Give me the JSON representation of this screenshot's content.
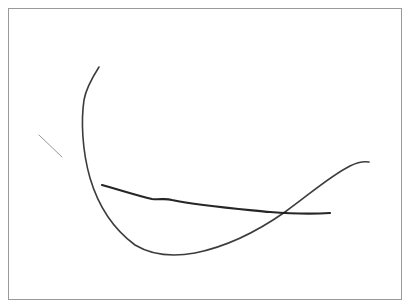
{
  "canvas": {
    "background": "#ffffff",
    "border_color": "#9a9a9a",
    "stroke_color": "#1a1a1a"
  },
  "strokes": [
    {
      "name": "large-curve",
      "path": "M99 67 C92 78 86 88 84 100 C81 120 82 150 90 178 C98 205 112 228 135 245 C150 254 168 258 195 253 C225 247 255 233 285 212 C310 194 330 176 350 166 C358 162 363 161 369 162",
      "width": 1.6,
      "opacity": 0.85
    },
    {
      "name": "horizontal-stroke",
      "path": "M102 185 C120 190 138 196 152 199 C160 200 165 198 172 200 C200 206 240 209 270 212 C295 214 315 214 330 213",
      "width": 2.2,
      "opacity": 0.95
    },
    {
      "name": "short-dash",
      "path": "M39 135 L62 157",
      "width": 1,
      "opacity": 0.45
    }
  ]
}
